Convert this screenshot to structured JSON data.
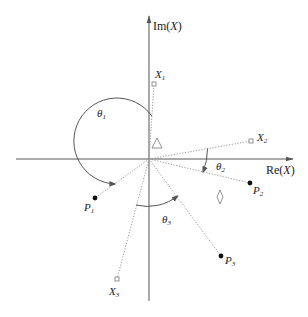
{
  "diagram": {
    "axes": {
      "x_label_main": "Re(",
      "x_label_var": "X",
      "x_label_close": ")",
      "y_label_main": "Im(",
      "y_label_var": "X",
      "y_label_close": ")"
    },
    "points": {
      "X1": {
        "name": "X",
        "sub": "1",
        "type": "hollow-square"
      },
      "X2": {
        "name": "X",
        "sub": "2",
        "type": "hollow-square"
      },
      "X3": {
        "name": "X",
        "sub": "3",
        "type": "hollow-square"
      },
      "P1": {
        "name": "P",
        "sub": "1",
        "type": "filled-dot"
      },
      "P2": {
        "name": "P",
        "sub": "2",
        "type": "filled-dot"
      },
      "P3": {
        "name": "P",
        "sub": "3",
        "type": "filled-dot"
      }
    },
    "angles": {
      "theta1": {
        "name": "θ",
        "sub": "1"
      },
      "theta2": {
        "name": "θ",
        "sub": "2"
      },
      "theta3": {
        "name": "θ",
        "sub": "3"
      }
    },
    "markers": {
      "triangle": "triangle-marker",
      "diamond": "diamond-marker"
    }
  }
}
